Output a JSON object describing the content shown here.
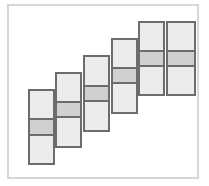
{
  "diagram": {
    "type": "staircase-bar-diagram",
    "colors": {
      "frame_border": "#d6d6d6",
      "bar_border": "#6c6c6c",
      "bar_fill": "#ececec",
      "band_fill": "#d0d0d0",
      "background": "#ffffff"
    },
    "bars": [
      {
        "x": 28,
        "top": 89,
        "bottom": 165,
        "band_top": 118,
        "band_bottom": 136,
        "width": 27
      },
      {
        "x": 55,
        "top": 72,
        "bottom": 148,
        "band_top": 101,
        "band_bottom": 118,
        "width": 27
      },
      {
        "x": 83,
        "top": 55,
        "bottom": 132,
        "band_top": 85,
        "band_bottom": 102,
        "width": 27
      },
      {
        "x": 111,
        "top": 38,
        "bottom": 114,
        "band_top": 67,
        "band_bottom": 84,
        "width": 27
      },
      {
        "x": 138,
        "top": 21,
        "bottom": 96,
        "band_top": 50,
        "band_bottom": 67,
        "width": 27
      },
      {
        "x": 166,
        "top": 21,
        "bottom": 96,
        "band_top": 50,
        "band_bottom": 67,
        "width": 30
      }
    ]
  }
}
